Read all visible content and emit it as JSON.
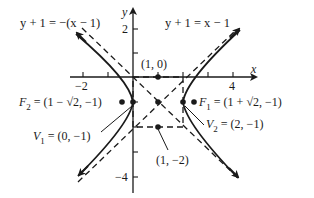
{
  "diagram": {
    "type": "hyperbola",
    "equation": "(x-1)^2 - (y+1)^2 = 1",
    "axes": {
      "x_label": "x",
      "y_label": "y",
      "x_ticks": [
        {
          "value": -2,
          "label": "−2"
        },
        {
          "value": -1,
          "label": ""
        },
        {
          "value": 1,
          "label": ""
        },
        {
          "value": 2,
          "label": ""
        },
        {
          "value": 3,
          "label": ""
        },
        {
          "value": 4,
          "label": "4"
        }
      ],
      "y_ticks": [
        {
          "value": 2,
          "label": "2"
        },
        {
          "value": 1,
          "label": ""
        },
        {
          "value": -1,
          "label": ""
        },
        {
          "value": -2,
          "label": ""
        },
        {
          "value": -3,
          "label": ""
        },
        {
          "value": -4,
          "label": "−4"
        }
      ]
    },
    "asymptotes": {
      "left_label": "y + 1 = −(x − 1)",
      "right_label": "y + 1 = x − 1"
    },
    "points": {
      "top": {
        "label": "(1, 0)",
        "x": 1,
        "y": 0
      },
      "bottom": {
        "label": "(1, −2)",
        "x": 1,
        "y": -2
      },
      "center": {
        "x": 1,
        "y": -1
      },
      "f1": {
        "name": "F",
        "sub": "1",
        "coords": " = (1 + √2, −1)"
      },
      "f2": {
        "name": "F",
        "sub": "2",
        "coords": " = (1 − √2, −1)"
      },
      "v1": {
        "name": "V",
        "sub": "1",
        "coords": " = (0, −1)"
      },
      "v2": {
        "name": "V",
        "sub": "2",
        "coords": " = (2, −1)"
      }
    },
    "colors": {
      "ink": "#1a1a1a",
      "background": "#ffffff"
    }
  }
}
